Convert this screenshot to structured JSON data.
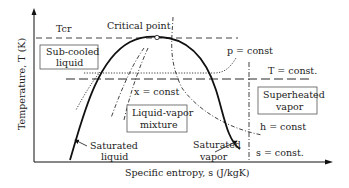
{
  "diagram": {
    "type": "T-s diagram",
    "axes": {
      "x_label": "Specific entropy, s (J/kgK)",
      "y_label": "Temperature, T (K)"
    },
    "labels": {
      "tcr": "Tcr",
      "critical_point": "Critical point",
      "subcooled_line1": "Sub-cooled",
      "subcooled_line2": "liquid",
      "p_const": "p = const",
      "t_const": "T = const.",
      "x_const": "x = const",
      "superheated_line1": "Superheated",
      "superheated_line2": "vapor",
      "mixture_line1": "Liquid-vapor",
      "mixture_line2": "mixture",
      "h_const": "h = const",
      "s_const": "s = const.",
      "sat_liquid_line1": "Saturated",
      "sat_liquid_line2": "liquid",
      "sat_vapor_line1": "Saturated",
      "sat_vapor_line2": "vapor"
    },
    "colors": {
      "line": "#111111",
      "text": "#222222",
      "box_border": "#555555",
      "background": "#ffffff"
    }
  }
}
